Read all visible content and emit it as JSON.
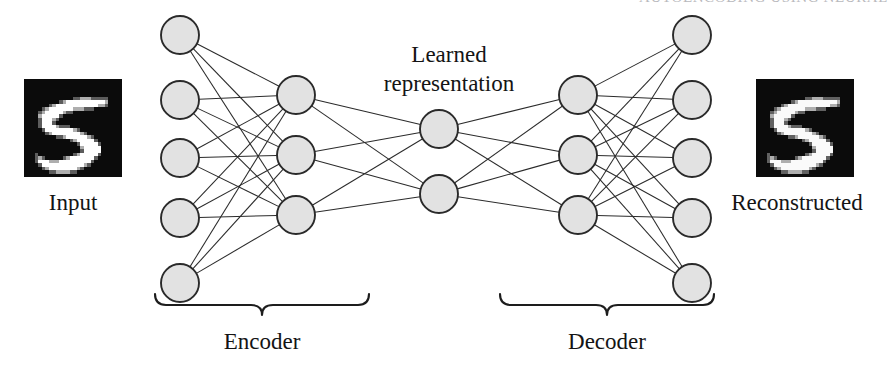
{
  "figure": {
    "title_bleed": "AUTOENCODING USING NEURAL",
    "labels": {
      "input": "Input",
      "reconstructed": "Reconstructed",
      "learned_line1": "Learned",
      "learned_line2": "representation",
      "encoder": "Encoder",
      "decoder": "Decoder"
    },
    "colors": {
      "node_fill": "#e2e2e2",
      "node_stroke": "#2a2a2a",
      "edge": "#2b2b2b",
      "brace": "#1d1d1d",
      "text": "#141414",
      "digit_background": "#0b0b0b",
      "digit_ink": "#ffffff",
      "page_background": "#ffffff"
    },
    "network": {
      "type": "autoencoder",
      "layers": [
        {
          "name": "input-layer",
          "node_count": 5,
          "cx": 180,
          "r": 19,
          "cys": [
            35,
            100,
            158,
            218,
            283
          ]
        },
        {
          "name": "encoder-hidden",
          "node_count": 3,
          "cx": 296,
          "r": 19,
          "cys": [
            95,
            155,
            215
          ]
        },
        {
          "name": "bottleneck",
          "node_count": 2,
          "cx": 439,
          "r": 19,
          "cys": [
            129,
            194
          ]
        },
        {
          "name": "decoder-hidden",
          "node_count": 3,
          "cx": 578,
          "r": 19,
          "cys": [
            95,
            155,
            215
          ]
        },
        {
          "name": "output-layer",
          "node_count": 5,
          "cx": 692,
          "r": 19,
          "cys": [
            35,
            100,
            158,
            218,
            283
          ]
        }
      ],
      "fully_connected": true
    },
    "braces": [
      {
        "name": "encoder-brace",
        "x_start": 155,
        "x_end": 369,
        "y": 305
      },
      {
        "name": "decoder-brace",
        "x_start": 500,
        "x_end": 714,
        "y": 305
      }
    ],
    "digit": {
      "value": "5",
      "source": "MNIST",
      "grid": 28,
      "pixels": [
        "0000000000000000000000000000",
        "0000000000000000000000000000",
        "0000000000000000000000000000",
        "0000000000000000000000000000",
        "0000000000000000000000000000",
        "0000000000000011222111110000",
        "0000000000123333333333320000",
        "0000000123333333333332210000",
        "0000012333333322211100000000",
        "0000123333321100000000000000",
        "0000233333100000000000000000",
        "0000133321000000000000000000",
        "0000133310000000000000000000",
        "0000133332111000000000000000",
        "0000013333333321000000000000",
        "0000001233333333210000000000",
        "0000000001123333332100000000",
        "0000000000000123333310000000",
        "0000000000000001333331000000",
        "0000000000000000233333000000",
        "0000000000000000133333000000",
        "0001000000000012333331000000",
        "0001210000012333333310000000",
        "0001333222333333333100000000",
        "0000133333333333321000000000",
        "0000012333333332100000000000",
        "0000000112222110000000000000",
        "0000000000000000000000000000"
      ]
    }
  }
}
